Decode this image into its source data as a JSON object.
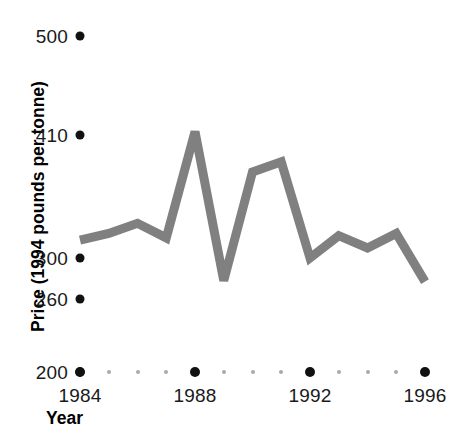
{
  "chart_data": {
    "type": "line",
    "title": "",
    "xlabel": "Year",
    "ylabel": "Price (1994 pounds per tonne)",
    "x": [
      1984,
      1985,
      1986,
      1987,
      1988,
      1989,
      1990,
      1991,
      1992,
      1993,
      1994,
      1995,
      1996
    ],
    "values": [
      316,
      322,
      331,
      318,
      413,
      278,
      377,
      386,
      300,
      320,
      309,
      322,
      277
    ],
    "series": [
      {
        "name": "Price",
        "color": "#808080",
        "values": [
          316,
          322,
          331,
          318,
          413,
          278,
          377,
          386,
          300,
          320,
          309,
          322,
          277
        ]
      }
    ],
    "x_tick_labels": [
      "1984",
      "1988",
      "1992",
      "1996"
    ],
    "x_tick_values": [
      1984,
      1988,
      1992,
      1996
    ],
    "y_tick_labels": [
      "500",
      "410",
      "300",
      "260",
      "200"
    ],
    "y_tick_values": [
      500,
      410,
      300,
      260,
      200
    ],
    "xlim": [
      1984,
      1996
    ],
    "ylim": [
      200,
      500
    ],
    "grid": false,
    "legend": false,
    "legend_position": "none"
  },
  "axes": {
    "y_title": "Price (1994 pounds per tonne)",
    "x_title": "Year",
    "y_ticks": [
      {
        "label": "500",
        "value": 500,
        "y": 36
      },
      {
        "label": "410",
        "value": 410,
        "y": 135
      },
      {
        "label": "300",
        "value": 300,
        "y": 258
      },
      {
        "label": "260",
        "value": 260,
        "y": 299
      },
      {
        "label": "200",
        "value": 200,
        "y": 372
      }
    ],
    "x_ticks": [
      {
        "label": "1984",
        "value": 1984,
        "x": 80
      },
      {
        "label": "1988",
        "value": 1988,
        "x": 195
      },
      {
        "label": "1992",
        "value": 1992,
        "x": 310
      },
      {
        "label": "1996",
        "value": 1996,
        "x": 425
      }
    ],
    "x_minor_values": [
      1985,
      1986,
      1987,
      1989,
      1990,
      1991,
      1993,
      1994,
      1995
    ]
  },
  "style": {
    "line_color": "#808080",
    "dot_color": "#111111",
    "minor_dot_color": "#a9a9a9",
    "text_color": "#1a1a1a",
    "background": "#ffffff",
    "line_width": 9
  }
}
